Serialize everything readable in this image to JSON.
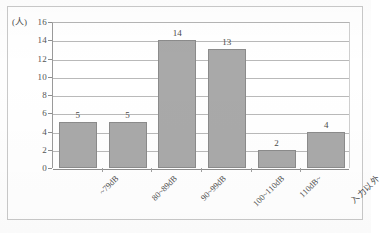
{
  "chart_data": {
    "type": "bar",
    "title": "",
    "subtitle": "",
    "xlabel": "",
    "ylabel": "(人)",
    "ylim": [
      0,
      16
    ],
    "ytick_step": 2,
    "yticks": [
      "16",
      "14",
      "12",
      "10",
      "8",
      "6",
      "4",
      "2",
      "0"
    ],
    "grid": true,
    "legend": "none",
    "categories": [
      "~79dB",
      "80~89dB",
      "90~99dB",
      "100~110dB",
      "110dB~",
      "入力以外"
    ],
    "values": [
      5,
      5,
      14,
      13,
      2,
      4
    ],
    "value_labels": [
      "5",
      "5",
      "14",
      "13",
      "2",
      "4"
    ],
    "series": [
      {
        "name": "人数",
        "values": [
          5,
          5,
          14,
          13,
          2,
          4
        ]
      }
    ]
  },
  "axis": {
    "y_unit": "(人)"
  },
  "colors": {
    "bar_fill": "#a9a9a9",
    "bar_border": "#8b8b8b",
    "gridline": "#b9b9b9",
    "axis": "#8e8e8e",
    "frame": "#c9c9c9",
    "text": "#4a4a4a",
    "background": "#ffffff"
  }
}
